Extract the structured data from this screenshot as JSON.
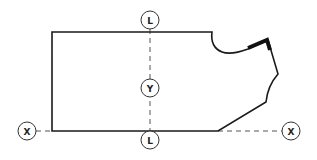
{
  "diagram": {
    "type": "pattern-piece-grainline",
    "colors": {
      "outline": "#1a1a1a",
      "dashed": "#555555",
      "marker_stroke": "#333333",
      "background": "#ffffff"
    },
    "markers": {
      "top_l": {
        "label": "L"
      },
      "center_y": {
        "label": "Y"
      },
      "bottom_l": {
        "label": "L"
      },
      "left_x": {
        "label": "X"
      },
      "right_x": {
        "label": "X"
      }
    }
  }
}
